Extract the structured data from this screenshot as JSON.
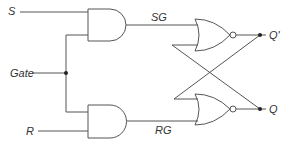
{
  "diagram": {
    "colors": {
      "wire": "#555555",
      "gate_stroke": "#555555",
      "junction": "#222222",
      "label": "#333333",
      "background": "#ffffff"
    },
    "inputs": {
      "s": "S",
      "gate": "Gate",
      "r": "R"
    },
    "signals": {
      "sg": "SG",
      "rg": "RG"
    },
    "outputs": {
      "q_prime": "Q'",
      "q": "Q"
    },
    "gates": [
      {
        "id": "and-1",
        "type": "AND",
        "inputs": [
          "S",
          "Gate"
        ],
        "output": "SG"
      },
      {
        "id": "and-2",
        "type": "AND",
        "inputs": [
          "Gate",
          "R"
        ],
        "output": "RG"
      },
      {
        "id": "nor-1",
        "type": "NOR",
        "inputs": [
          "SG",
          "Q"
        ],
        "output": "Q'"
      },
      {
        "id": "nor-2",
        "type": "NOR",
        "inputs": [
          "Q'",
          "RG"
        ],
        "output": "Q"
      }
    ]
  }
}
